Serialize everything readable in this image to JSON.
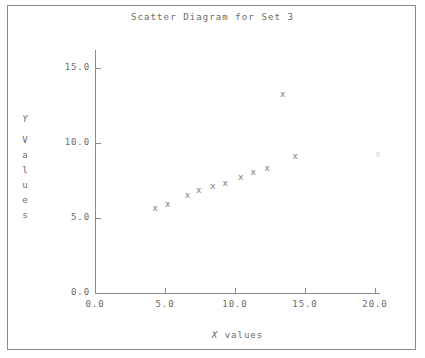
{
  "chart_data": {
    "type": "scatter",
    "title": "Scatter Diagram for Set 3",
    "xlabel": "X values",
    "ylabel": "Y Values",
    "ylabel_stacked": [
      "Y",
      "V",
      "a",
      "l",
      "u",
      "e",
      "s"
    ],
    "xlim": [
      0.0,
      20.5
    ],
    "ylim": [
      0.0,
      16.2
    ],
    "grid": false,
    "legend": null,
    "marker": "x",
    "marker_color": "#7b7b7b",
    "xticks": [
      0.0,
      5.0,
      10.0,
      15.0,
      20.0
    ],
    "xtick_labels": [
      "0.0",
      "5.0",
      "10.0",
      "15.0",
      "20.0"
    ],
    "yticks": [
      0.0,
      5.0,
      10.0,
      15.0
    ],
    "ytick_labels": [
      "0.0",
      "5.0",
      "10.0",
      "15.0"
    ],
    "points": [
      {
        "x": 4.3,
        "y": 5.6,
        "faint": false
      },
      {
        "x": 5.2,
        "y": 5.9,
        "faint": false
      },
      {
        "x": 6.6,
        "y": 6.5,
        "faint": false
      },
      {
        "x": 7.4,
        "y": 6.8,
        "faint": false
      },
      {
        "x": 8.4,
        "y": 7.1,
        "faint": false
      },
      {
        "x": 9.3,
        "y": 7.3,
        "faint": false
      },
      {
        "x": 10.4,
        "y": 7.7,
        "faint": false
      },
      {
        "x": 11.3,
        "y": 8.0,
        "faint": false
      },
      {
        "x": 12.3,
        "y": 8.3,
        "faint": false
      },
      {
        "x": 13.4,
        "y": 13.2,
        "faint": false
      },
      {
        "x": 14.3,
        "y": 9.1,
        "faint": false
      },
      {
        "x": 20.2,
        "y": 9.2,
        "faint": true
      }
    ]
  },
  "figure": {
    "background": "#ffffff",
    "frame_color": "#8a8a8a",
    "text_color": "#6b6b6b"
  }
}
